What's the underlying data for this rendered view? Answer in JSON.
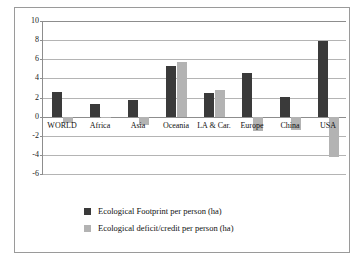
{
  "chart_data": {
    "type": "bar",
    "title": "",
    "subtitle": "",
    "xlabel": "",
    "ylabel": "",
    "ylim": [
      -6,
      10
    ],
    "ytick_step": 2,
    "yticks": [
      10,
      8,
      6,
      4,
      2,
      0,
      -2,
      -4,
      -6
    ],
    "ytick_labels": [
      "10",
      "8",
      "6",
      "4",
      "2",
      "0",
      "-2",
      "-4",
      "-6"
    ],
    "grid": true,
    "grid_axis": "y",
    "legend_position": "bottom",
    "categories": [
      "WORLD",
      "Africa",
      "Asia",
      "Oceania",
      "LA & Car.",
      "Europe",
      "China",
      "USA"
    ],
    "series": [
      {
        "name": "Ecological Footprint per person (ha)",
        "color": "#3a3a3a",
        "values": [
          2.6,
          1.35,
          1.75,
          5.3,
          2.5,
          4.55,
          2.05,
          7.9
        ]
      },
      {
        "name": "Ecological deficit/credit per person (ha)",
        "color": "#b3b3b3",
        "values": [
          -0.7,
          -0.05,
          -0.9,
          5.7,
          2.8,
          -1.5,
          -1.4,
          -4.2
        ]
      }
    ]
  },
  "legend": {
    "items": [
      {
        "label": "Ecological Footprint per person (ha)",
        "color": "#3a3a3a",
        "swatch_name": "legend-swatch-footprint"
      },
      {
        "label": "Ecological deficit/credit per person (ha)",
        "color": "#b3b3b3",
        "swatch_name": "legend-swatch-deficit"
      }
    ]
  },
  "colors": {
    "series_dark": "#3a3a3a",
    "series_light": "#b3b3b3",
    "gridline": "#b4b4b4",
    "axis": "#8d8d8d",
    "frame": "#9a9a9a",
    "background": "#ffffff",
    "text": "#111111"
  }
}
